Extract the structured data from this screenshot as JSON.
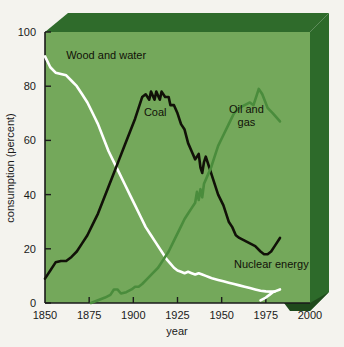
{
  "chart_data": {
    "type": "line",
    "title": "",
    "xlabel": "year",
    "ylabel": "consumption (percent)",
    "xlim": [
      1850,
      2000
    ],
    "ylim": [
      0,
      100
    ],
    "xticks": [
      "1850",
      "1875",
      "1900",
      "1925",
      "1950",
      "1975",
      "2000"
    ],
    "yticks": [
      "0",
      "20",
      "40",
      "60",
      "80",
      "100"
    ],
    "grid": false,
    "legend_position": "inline-annotations",
    "colors": {
      "plot_background": "#74a85b",
      "panel_top": "#2f6b2b",
      "panel_side": "#2d6a2a",
      "panel_edge": "#1f4a1c",
      "page_background": "#f4f3ee",
      "wood_and_water": "#ffffff",
      "coal": "#111108",
      "oil_and_gas": "#4a8c3c",
      "nuclear_energy": "#ffffff"
    },
    "series": [
      {
        "name": "Wood and water",
        "color": "#ffffff",
        "label_x": 1862,
        "label_y": 90,
        "points": [
          [
            1850,
            91
          ],
          [
            1853,
            87
          ],
          [
            1856,
            85
          ],
          [
            1859,
            84.5
          ],
          [
            1862,
            84
          ],
          [
            1865,
            82
          ],
          [
            1868,
            80
          ],
          [
            1871,
            77
          ],
          [
            1874,
            74
          ],
          [
            1877,
            70
          ],
          [
            1880,
            66
          ],
          [
            1883,
            61
          ],
          [
            1886,
            56
          ],
          [
            1889,
            52
          ],
          [
            1892,
            48
          ],
          [
            1895,
            44
          ],
          [
            1898,
            40
          ],
          [
            1901,
            36
          ],
          [
            1904,
            32
          ],
          [
            1907,
            28
          ],
          [
            1910,
            25
          ],
          [
            1913,
            22
          ],
          [
            1916,
            19
          ],
          [
            1919,
            16
          ],
          [
            1921,
            14.5
          ],
          [
            1923,
            13
          ],
          [
            1925,
            12
          ],
          [
            1927,
            11.5
          ],
          [
            1929,
            11
          ],
          [
            1931,
            11.5
          ],
          [
            1933,
            11
          ],
          [
            1935,
            10.5
          ],
          [
            1937,
            11
          ],
          [
            1939,
            10.5
          ],
          [
            1941,
            10
          ],
          [
            1943,
            9.5
          ],
          [
            1945,
            9
          ],
          [
            1948,
            8.5
          ],
          [
            1951,
            8
          ],
          [
            1954,
            7.5
          ],
          [
            1957,
            7
          ],
          [
            1960,
            6.5
          ],
          [
            1963,
            6
          ],
          [
            1966,
            5.5
          ],
          [
            1969,
            5
          ],
          [
            1972,
            4.5
          ],
          [
            1975,
            4.3
          ],
          [
            1978,
            4.2
          ],
          [
            1980,
            4.2
          ]
        ]
      },
      {
        "name": "Coal",
        "color": "#111108",
        "label_x": 1906,
        "label_y": 69,
        "points": [
          [
            1850,
            9
          ],
          [
            1853,
            12
          ],
          [
            1856,
            15
          ],
          [
            1859,
            15.5
          ],
          [
            1862,
            15.5
          ],
          [
            1865,
            17
          ],
          [
            1868,
            19
          ],
          [
            1871,
            22
          ],
          [
            1874,
            25
          ],
          [
            1877,
            29
          ],
          [
            1880,
            33
          ],
          [
            1883,
            38
          ],
          [
            1886,
            43
          ],
          [
            1889,
            48
          ],
          [
            1892,
            53
          ],
          [
            1895,
            58
          ],
          [
            1898,
            63
          ],
          [
            1901,
            68
          ],
          [
            1903,
            72
          ],
          [
            1905,
            76
          ],
          [
            1907,
            77
          ],
          [
            1909,
            75
          ],
          [
            1910,
            78
          ],
          [
            1912,
            75
          ],
          [
            1913,
            78
          ],
          [
            1915,
            75
          ],
          [
            1916,
            78
          ],
          [
            1918,
            76
          ],
          [
            1920,
            76
          ],
          [
            1921,
            73
          ],
          [
            1923,
            73
          ],
          [
            1925,
            70
          ],
          [
            1927,
            66
          ],
          [
            1929,
            64
          ],
          [
            1931,
            59
          ],
          [
            1933,
            56
          ],
          [
            1935,
            53
          ],
          [
            1937,
            55
          ],
          [
            1938,
            50
          ],
          [
            1939,
            48
          ],
          [
            1940,
            52
          ],
          [
            1941,
            54
          ],
          [
            1943,
            50
          ],
          [
            1945,
            46
          ],
          [
            1948,
            40
          ],
          [
            1951,
            36
          ],
          [
            1954,
            30
          ],
          [
            1956,
            28
          ],
          [
            1958,
            25
          ],
          [
            1960,
            24
          ],
          [
            1963,
            23
          ],
          [
            1966,
            22
          ],
          [
            1969,
            21
          ],
          [
            1972,
            19
          ],
          [
            1974,
            18
          ],
          [
            1976,
            18
          ],
          [
            1978,
            19
          ],
          [
            1980,
            21
          ],
          [
            1983,
            24
          ]
        ]
      },
      {
        "name": "Oil and gas",
        "color": "#4a8c3c",
        "label_x": 1964,
        "label_y": 70,
        "label_line2": "gas",
        "points": [
          [
            1876,
            0
          ],
          [
            1880,
            1
          ],
          [
            1884,
            2
          ],
          [
            1887,
            3
          ],
          [
            1889,
            5
          ],
          [
            1891,
            5
          ],
          [
            1893,
            3.5
          ],
          [
            1896,
            4
          ],
          [
            1899,
            5
          ],
          [
            1901,
            6
          ],
          [
            1903,
            6
          ],
          [
            1905,
            7
          ],
          [
            1908,
            9
          ],
          [
            1911,
            11
          ],
          [
            1914,
            13
          ],
          [
            1917,
            16
          ],
          [
            1920,
            19
          ],
          [
            1923,
            23
          ],
          [
            1926,
            27
          ],
          [
            1929,
            31
          ],
          [
            1931,
            33
          ],
          [
            1933,
            35
          ],
          [
            1935,
            37
          ],
          [
            1936,
            41
          ],
          [
            1937,
            38
          ],
          [
            1938,
            42
          ],
          [
            1939,
            39
          ],
          [
            1940,
            44
          ],
          [
            1942,
            47
          ],
          [
            1944,
            50
          ],
          [
            1946,
            54
          ],
          [
            1948,
            58
          ],
          [
            1951,
            62
          ],
          [
            1954,
            66
          ],
          [
            1957,
            70
          ],
          [
            1960,
            72
          ],
          [
            1963,
            73
          ],
          [
            1966,
            74
          ],
          [
            1968,
            73
          ],
          [
            1970,
            77
          ],
          [
            1971,
            79
          ],
          [
            1973,
            77
          ],
          [
            1976,
            72
          ],
          [
            1979,
            70
          ],
          [
            1983,
            67
          ]
        ]
      },
      {
        "name": "Nuclear energy",
        "color": "#ffffff",
        "label_x": 1957,
        "label_y": 13,
        "points": [
          [
            1972,
            1
          ],
          [
            1975,
            2
          ],
          [
            1977,
            3
          ],
          [
            1979,
            4
          ],
          [
            1983,
            5
          ]
        ]
      }
    ]
  }
}
